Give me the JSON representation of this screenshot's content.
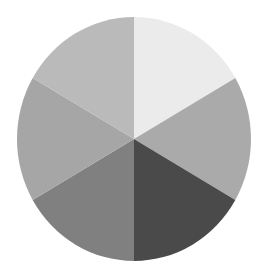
{
  "chart_data": {
    "type": "pie",
    "title": "",
    "start_angle_deg": 0,
    "direction": "clockwise",
    "categories": [
      "Slice 1",
      "Slice 2",
      "Slice 3",
      "Slice 4",
      "Slice 5",
      "Slice 6"
    ],
    "values": [
      1,
      1,
      1,
      1,
      1,
      1
    ],
    "colors": [
      "#ebebeb",
      "#aaaaaa",
      "#4a4a4a",
      "#808080",
      "#a6a6a6",
      "#bababa"
    ],
    "labels_visible": false,
    "legend": "none",
    "geometry": {
      "cx": 134,
      "cy": 139,
      "rx": 117,
      "ry": 122
    }
  }
}
